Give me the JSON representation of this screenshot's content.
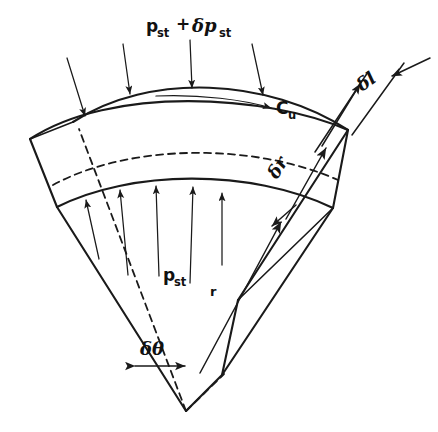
{
  "figure": {
    "domain": "diagram",
    "kind": "engineering-line-drawing",
    "background_color": "#ffffff",
    "line_color": "#1a1a1a"
  },
  "labels": {
    "outer_pressure": {
      "base": "p",
      "base_sub": "st",
      "plus": "+",
      "delta": "δp",
      "delta_sub": "st",
      "full": "p_st + δp_st"
    },
    "inner_pressure": {
      "base": "p",
      "base_sub": "st",
      "full": "p_st"
    },
    "tangential_velocity": {
      "base": "C",
      "base_sub": "u",
      "full": "C_u"
    },
    "axial_width": {
      "text": "δl"
    },
    "radial_thickness": {
      "text": "δr"
    },
    "angular_width": {
      "text": "δθ"
    },
    "radius": {
      "text": "r"
    }
  },
  "annotations": {
    "outer_pressure_arrow_count": 4,
    "inner_pressure_arrow_count": 5,
    "outer_arrow_direction": "inward-radial (downward onto outer arc)",
    "inner_arrow_direction": "outward-radial (upward onto inner arc)",
    "velocity_arrow_direction": "tangential, pointing right along outer arc",
    "hidden_edges_style": "dashed",
    "delta_l_dimension": "double-ended arrow across axial depth at top right",
    "delta_r_dimension": "arrow along right radial face between inner and outer arcs",
    "delta_theta_dimension": "double-headed horizontal arrow near apex"
  }
}
